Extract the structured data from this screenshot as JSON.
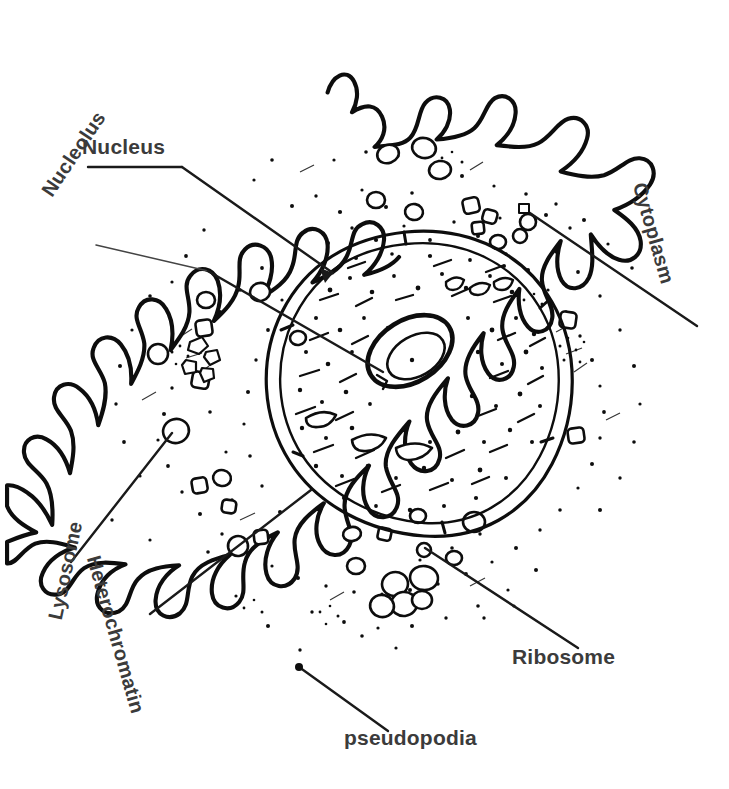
{
  "diagram": {
    "style": "black ink line drawing on white background",
    "background_color": "#ffffff",
    "ink_color": "#0d0d0d",
    "label_color": "#3b3b3b"
  },
  "labels": {
    "nucleus": "Nucleus",
    "nucleolus": "Nucleolus",
    "cytoplasm": "Cytoplasm",
    "lysosome": "Lysosome",
    "heterochromatin": "Heterochromatin",
    "ribosome": "Ribosome",
    "pseudopodia": "pseudopodia"
  },
  "annotations": [
    {
      "name": "nucleus",
      "text": "Nucleus",
      "rotation_deg": 0,
      "label_xy": [
        82,
        135
      ],
      "leader_from": [
        92,
        167
      ],
      "leader_to": [
        333,
        273
      ],
      "arrowhead": true
    },
    {
      "name": "nucleolus",
      "text": "Nucleolus",
      "rotation_deg": -56,
      "label_xy": [
        37,
        188
      ],
      "leader_from": [
        96,
        245
      ],
      "leader_to": [
        383,
        372
      ],
      "arrowhead": false
    },
    {
      "name": "cytoplasm",
      "text": "Cytoplasm",
      "rotation_deg": 74,
      "label_xy": [
        650,
        180
      ],
      "leader_from": [
        524,
        209
      ],
      "leader_to": [
        697,
        326
      ],
      "arrowhead": false
    },
    {
      "name": "lysosome",
      "text": "Lysosome",
      "rotation_deg": -78,
      "label_xy": [
        44,
        617
      ],
      "leader_from": [
        73,
        560
      ],
      "leader_to": [
        172,
        431
      ],
      "arrowhead": false
    },
    {
      "name": "heterochromatin",
      "text": "Heterochromatin",
      "rotation_deg": 74,
      "label_xy": [
        104,
        553
      ],
      "leader_from": [
        150,
        612
      ],
      "leader_to": [
        311,
        490
      ],
      "arrowhead": false
    },
    {
      "name": "ribosome",
      "text": "Ribosome",
      "rotation_deg": 0,
      "label_xy": [
        512,
        645
      ],
      "leader_from": [
        425,
        548
      ],
      "leader_to": [
        578,
        648
      ],
      "arrowhead": false
    },
    {
      "name": "pseudopodia",
      "text": "pseudopodia",
      "rotation_deg": 0,
      "label_xy": [
        344,
        726
      ],
      "leader_from": [
        299,
        667
      ],
      "leader_to": [
        388,
        731
      ],
      "arrowhead": false
    }
  ],
  "structures": {
    "cell_membrane": "lobed pseudopodia-covered outline",
    "nucleus": "large double-membraned oval in centre",
    "nucleolus": "tilted oval with inner oval, inside nucleus",
    "heterochromatin": "dark granular specks and dashes inside nucleus",
    "lysosome": "small rounded vesicle in cytoplasm, left of nucleus",
    "ribosomes": "cluster of small rounded vesicles, lower cytoplasm",
    "cytoplasm": "stippled region between membrane and nucleus"
  }
}
